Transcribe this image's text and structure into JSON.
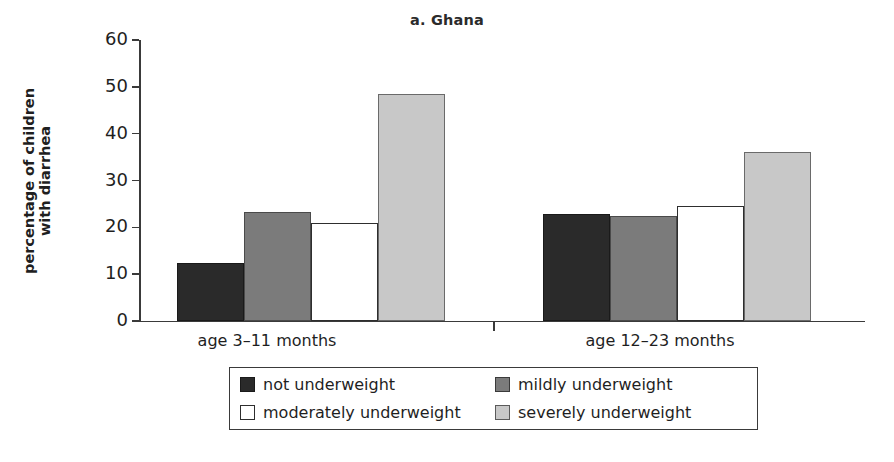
{
  "chart_data": {
    "type": "bar",
    "title": "a. Ghana",
    "xlabel": "",
    "ylabel": "percentage of children\nwith diarrhea",
    "ylabel_line1": "percentage of children",
    "ylabel_line2": "with diarrhea",
    "categories": [
      "age 3–11 months",
      "age 12–23 months"
    ],
    "ylim": [
      0,
      60
    ],
    "yticks": [
      0,
      10,
      20,
      30,
      40,
      50,
      60
    ],
    "ytick_labels": [
      "0",
      "10",
      "20",
      "30",
      "40",
      "50",
      "60"
    ],
    "grid": false,
    "legend_position": "bottom-center",
    "series": [
      {
        "name": "not underweight",
        "color": "#2a2a2a",
        "values": [
          12.4,
          22.8
        ]
      },
      {
        "name": "mildly underweight",
        "color": "#7b7b7b",
        "values": [
          23.2,
          22.4
        ]
      },
      {
        "name": "moderately underweight",
        "color": "#ffffff",
        "values": [
          21.0,
          24.5
        ]
      },
      {
        "name": "severely underweight",
        "color": "#c8c8c8",
        "values": [
          48.5,
          36.0
        ]
      }
    ]
  },
  "legend": {
    "items": [
      {
        "label": "not underweight",
        "swatch": "black-swatch"
      },
      {
        "label": "mildly underweight",
        "swatch": "dark-gray-swatch"
      },
      {
        "label": "moderately underweight",
        "swatch": "white-swatch"
      },
      {
        "label": "severely underweight",
        "swatch": "light-gray-swatch"
      }
    ]
  },
  "axis": {
    "y_title_line1": "percentage of children",
    "y_title_line2": "with diarrhea",
    "tick_0": "0",
    "tick_10": "10",
    "tick_20": "20",
    "tick_30": "30",
    "tick_40": "40",
    "tick_50": "50",
    "tick_60": "60"
  }
}
